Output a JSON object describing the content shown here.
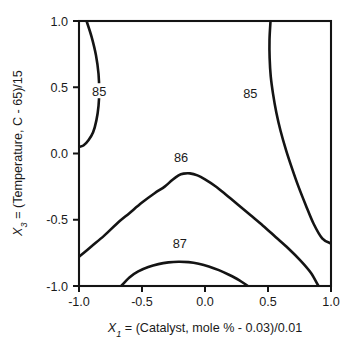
{
  "chart_data": {
    "type": "line",
    "subtype": "contour",
    "title": "",
    "xlabel": "X1 = (Catalyst, mole % - 0.03)/0.01",
    "ylabel": "X3 = (Temperature, C - 65)/15",
    "xlabel_parts": {
      "var": "X",
      "sub": "1",
      "rest": " = (Catalyst, mole % - 0.03)/0.01"
    },
    "ylabel_parts": {
      "var": "X",
      "sub": "3",
      "rest": " = (Temperature, C - 65)/15"
    },
    "xlim": [
      -1.0,
      1.0
    ],
    "ylim": [
      -1.0,
      1.0
    ],
    "grid": false,
    "legend": "none",
    "xticks": [
      -1.0,
      -0.5,
      0.0,
      0.5,
      1.0
    ],
    "yticks": [
      -1.0,
      -0.5,
      0.0,
      0.5,
      1.0
    ],
    "xticklabels": [
      "-1.0",
      "-0.5",
      "0.0",
      "0.5",
      "1.0"
    ],
    "yticklabels": [
      "-1.0",
      "-0.5",
      "0.0",
      "0.5",
      "1.0"
    ],
    "contour_levels": [
      85,
      86,
      87
    ],
    "contours": [
      {
        "level": 85,
        "label": "85",
        "name": "left-85-contour",
        "label_xy": [
          -0.84,
          0.47
        ],
        "points": [
          [
            -0.94,
            1.0
          ],
          [
            -0.9,
            0.88
          ],
          [
            -0.865,
            0.74
          ],
          [
            -0.845,
            0.6
          ],
          [
            -0.84,
            0.47
          ],
          [
            -0.845,
            0.36
          ],
          [
            -0.862,
            0.25
          ],
          [
            -0.888,
            0.16
          ],
          [
            -0.925,
            0.1
          ],
          [
            -0.965,
            0.06
          ],
          [
            -1.0,
            0.05
          ]
        ]
      },
      {
        "level": 85,
        "label": "85",
        "name": "right-85-contour",
        "label_xy": [
          0.36,
          0.45
        ],
        "points": [
          [
            0.52,
            1.0
          ],
          [
            0.512,
            0.86
          ],
          [
            0.513,
            0.72
          ],
          [
            0.522,
            0.58
          ],
          [
            0.54,
            0.45
          ],
          [
            0.566,
            0.31
          ],
          [
            0.6,
            0.17
          ],
          [
            0.642,
            0.03
          ],
          [
            0.69,
            -0.11
          ],
          [
            0.742,
            -0.25
          ],
          [
            0.8,
            -0.39
          ],
          [
            0.862,
            -0.53
          ],
          [
            0.93,
            -0.64
          ],
          [
            1.0,
            -0.68
          ]
        ]
      },
      {
        "level": 86,
        "label": "86",
        "name": "86-contour",
        "label_xy": [
          -0.19,
          -0.03
        ],
        "points": [
          [
            -1.0,
            -0.78
          ],
          [
            -0.9,
            -0.7
          ],
          [
            -0.8,
            -0.62
          ],
          [
            -0.7,
            -0.53
          ],
          [
            -0.6,
            -0.45
          ],
          [
            -0.5,
            -0.37
          ],
          [
            -0.4,
            -0.3
          ],
          [
            -0.32,
            -0.25
          ],
          [
            -0.26,
            -0.2
          ],
          [
            -0.21,
            -0.165
          ],
          [
            -0.17,
            -0.152
          ],
          [
            -0.12,
            -0.15
          ],
          [
            -0.06,
            -0.165
          ],
          [
            0.0,
            -0.195
          ],
          [
            0.08,
            -0.245
          ],
          [
            0.16,
            -0.305
          ],
          [
            0.26,
            -0.385
          ],
          [
            0.36,
            -0.465
          ],
          [
            0.46,
            -0.545
          ],
          [
            0.56,
            -0.63
          ],
          [
            0.66,
            -0.715
          ],
          [
            0.76,
            -0.81
          ],
          [
            0.84,
            -0.9
          ],
          [
            0.9,
            -1.0
          ]
        ]
      },
      {
        "level": 87,
        "label": "87",
        "name": "87-contour",
        "label_xy": [
          -0.2,
          -0.68
        ],
        "points": [
          [
            -0.665,
            -1.0
          ],
          [
            -0.6,
            -0.935
          ],
          [
            -0.53,
            -0.89
          ],
          [
            -0.45,
            -0.857
          ],
          [
            -0.37,
            -0.835
          ],
          [
            -0.29,
            -0.822
          ],
          [
            -0.21,
            -0.817
          ],
          [
            -0.13,
            -0.82
          ],
          [
            -0.05,
            -0.832
          ],
          [
            0.03,
            -0.852
          ],
          [
            0.11,
            -0.88
          ],
          [
            0.19,
            -0.915
          ],
          [
            0.27,
            -0.955
          ],
          [
            0.34,
            -1.0
          ]
        ]
      }
    ],
    "axis": {
      "plot_left_px": 79,
      "plot_right_px": 331,
      "plot_top_px": 21,
      "plot_bottom_px": 286,
      "tick_length_px": 6,
      "line_color": "#141414"
    }
  }
}
